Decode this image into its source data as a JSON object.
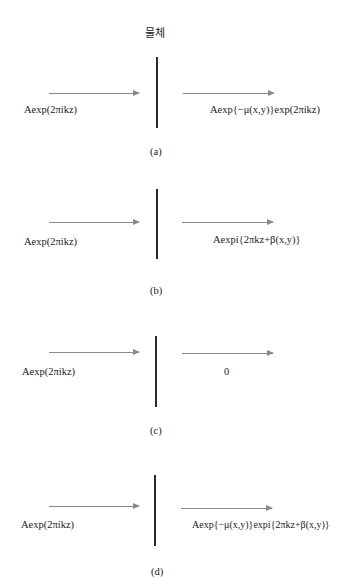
{
  "figure": {
    "object_label": "물체",
    "panels": [
      {
        "caption": "(a)",
        "input": "Aexp(2πikz)",
        "output": "Aexp{−μ(x,y)}exp(2πikz)"
      },
      {
        "caption": "(b)",
        "input": "Aexp(2πikz)",
        "output": "Aexpi{2πkz+β(x,y)}"
      },
      {
        "caption": "(c)",
        "input": "Aexp(2πikz)",
        "output": "0"
      },
      {
        "caption": "(d)",
        "input": "Aexp(2πikz)",
        "output": "Aexp{−μ(x,y)}expi{2πkz+β(x,y)}"
      }
    ]
  }
}
